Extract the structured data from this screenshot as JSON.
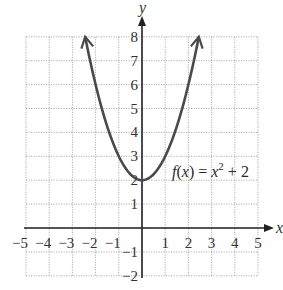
{
  "chart_data": {
    "type": "line",
    "title": "",
    "xlabel": "x",
    "ylabel": "y",
    "xlim": [
      -5,
      5
    ],
    "ylim": [
      -2,
      8
    ],
    "grid": true,
    "grid_style": "dotted",
    "x_ticks": [
      -5,
      -4,
      -3,
      -2,
      -1,
      1,
      2,
      3,
      4,
      5
    ],
    "y_ticks": [
      -2,
      -1,
      1,
      2,
      3,
      4,
      5,
      6,
      7,
      8
    ],
    "x_tick_labels": [
      "−5",
      "−4",
      "−3",
      "−2",
      "−1",
      "1",
      "2",
      "3",
      "4",
      "5"
    ],
    "y_tick_labels": [
      "−2",
      "−1",
      "1",
      "2",
      "3",
      "4",
      "5",
      "6",
      "7",
      "8"
    ],
    "series": [
      {
        "name": "f(x) = x² + 2",
        "expression": "x^2 + 2",
        "domain": [
          -2.45,
          2.45
        ],
        "x": [
          -2.45,
          -2,
          -1.5,
          -1,
          -0.5,
          0,
          0.5,
          1,
          1.5,
          2,
          2.45
        ],
        "values": [
          8.0,
          6,
          4.25,
          3,
          2.25,
          2,
          2.25,
          3,
          4.25,
          6,
          8.0
        ],
        "arrows_at_ends": true,
        "color": "#4a4a4a"
      }
    ],
    "annotations": [
      {
        "text": "f(x) = x² + 2",
        "x": 1.3,
        "y": 2.5
      }
    ]
  },
  "labels": {
    "x_axis": "x",
    "y_axis": "y",
    "function_f": "f",
    "function_paren_open": "(",
    "function_var": "x",
    "function_paren_close": ")",
    "function_eq": " = ",
    "function_x": "x",
    "function_exp": "2",
    "function_rest": " + 2"
  }
}
